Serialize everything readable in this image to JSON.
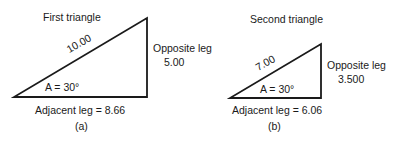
{
  "figure_a": {
    "title": "First triangle",
    "hypotenuse": "10.00",
    "angle": "A = 30°",
    "opposite_label": "Opposite leg",
    "opposite_value": "5.00",
    "adjacent": "Adjacent leg = 8.66",
    "caption": "(a)"
  },
  "figure_b": {
    "title": "Second triangle",
    "hypotenuse": "7.00",
    "angle": "A = 30°",
    "opposite_label": "Opposite leg",
    "opposite_value": "3.500",
    "adjacent": "Adjacent leg = 6.06",
    "caption": "(b)"
  },
  "colors": {
    "stroke": "#1a1a1a",
    "background": "#ffffff"
  }
}
